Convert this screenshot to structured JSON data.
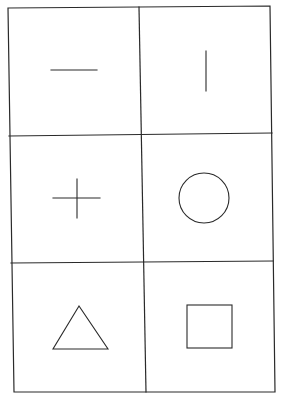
{
  "diagram": {
    "title": "Grid of six simple figures",
    "layout": {
      "columns": 2,
      "rows": 3
    },
    "line_color": "#2a2a2a",
    "background": "#ffffff",
    "cells": [
      {
        "row": 1,
        "column": 1,
        "figure": "horizontal-line",
        "label": "Horizontal line"
      },
      {
        "row": 1,
        "column": 2,
        "figure": "vertical-line",
        "label": "Vertical line"
      },
      {
        "row": 2,
        "column": 1,
        "figure": "plus-cross",
        "label": "Plus sign"
      },
      {
        "row": 2,
        "column": 2,
        "figure": "circle",
        "label": "Circle"
      },
      {
        "row": 3,
        "column": 1,
        "figure": "triangle",
        "label": "Triangle"
      },
      {
        "row": 3,
        "column": 2,
        "figure": "square",
        "label": "Square"
      }
    ]
  }
}
